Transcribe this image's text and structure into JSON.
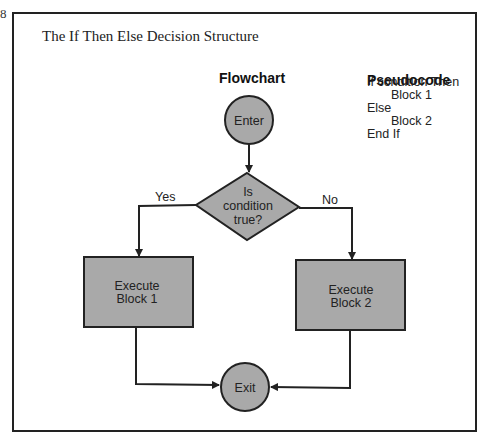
{
  "page": {
    "page_number": "8",
    "title": "The If Then Else Decision Structure"
  },
  "flowchart": {
    "heading": "Flowchart",
    "enter_label": "Enter",
    "decision_lines": [
      "Is",
      "condition",
      "true?"
    ],
    "yes_label": "Yes",
    "no_label": "No",
    "block1_lines": [
      "Execute",
      "Block 1"
    ],
    "block2_lines": [
      "Execute",
      "Block 2"
    ],
    "exit_label": "Exit",
    "fill_color": "#a9a9a9",
    "stroke_color": "#222222"
  },
  "pseudocode": {
    "heading": "Pseudocode",
    "lines": [
      {
        "text": "If condition Then",
        "indent": false
      },
      {
        "text": "Block 1",
        "indent": true
      },
      {
        "text": "Else",
        "indent": false
      },
      {
        "text": "Block 2",
        "indent": true
      },
      {
        "text": "End If",
        "indent": false
      }
    ]
  }
}
